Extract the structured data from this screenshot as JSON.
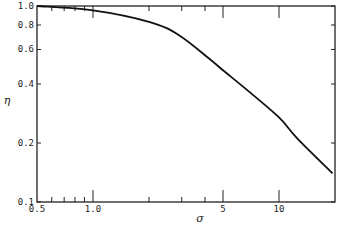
{
  "chart_data": {
    "type": "line",
    "title": "",
    "xlabel": "σ",
    "ylabel": "η",
    "xscale": "log",
    "yscale": "log",
    "xlim": [
      0.5,
      20
    ],
    "ylim": [
      0.1,
      1.0
    ],
    "grid": false,
    "legend": null,
    "x_ticks": [
      "0.5",
      "1.0",
      "5",
      "10"
    ],
    "y_ticks": [
      "0.1",
      "0.2",
      "0.4",
      "0.6",
      "0.8",
      "1.0"
    ],
    "series": [
      {
        "name": "η(σ)",
        "x": [
          0.5,
          1.0,
          2.0,
          2.9,
          4.3,
          5.0,
          6.8,
          10.0,
          12.6,
          19.4
        ],
        "y": [
          1.0,
          0.95,
          0.83,
          0.71,
          0.53,
          0.47,
          0.37,
          0.27,
          0.21,
          0.14
        ]
      }
    ]
  }
}
